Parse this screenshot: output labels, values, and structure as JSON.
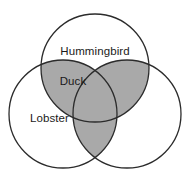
{
  "diagram": {
    "type": "venn-3-circle",
    "background_color": "#ffffff",
    "stroke_color": "#2b2b2b",
    "stroke_width": 1.3,
    "shade_color": "#a9a9a9",
    "unshaded_color": "#ffffff",
    "text_color": "#1a1a1a",
    "circles": [
      {
        "id": "top",
        "name": "hummingbird-circle",
        "cx": 95,
        "cy": 68,
        "r": 54
      },
      {
        "id": "bottom-left",
        "name": "lobster-circle",
        "cx": 63,
        "cy": 114,
        "r": 54
      },
      {
        "id": "bottom-right",
        "name": "right-circle",
        "cx": 127,
        "cy": 114,
        "r": 54
      }
    ],
    "shaded_regions": [
      "top-and-bottom-left",
      "top-and-bottom-right",
      "bottom-left-and-bottom-right",
      "all-three"
    ],
    "labels": [
      {
        "name": "hummingbird-label",
        "text": "Hummingbird",
        "x": 95,
        "y": 51.5,
        "region": "top-circle-only"
      },
      {
        "name": "duck-label",
        "text": "Duck",
        "x": 73,
        "y": 81.5,
        "region": "top-and-bottom-left-overlap"
      },
      {
        "name": "lobster-label",
        "text": "Lobster",
        "x": 49.5,
        "y": 118.5,
        "region": "bottom-left-circle-only"
      }
    ]
  }
}
